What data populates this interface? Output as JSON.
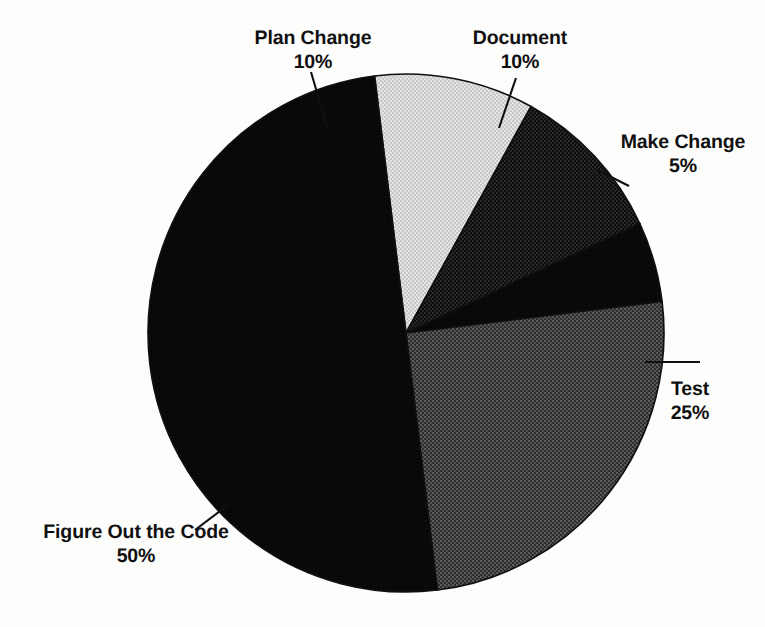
{
  "figure": {
    "background_color": "#fdfdfc",
    "ink_color": "#101010"
  },
  "chart_data": {
    "type": "pie",
    "title": "",
    "subtitle": "",
    "xlabel": "",
    "ylabel": "",
    "legend_position": "none",
    "grid": false,
    "labels_show_percent": true,
    "start_angle_deg": -97,
    "direction": "clockwise",
    "categories": [
      "Plan Change",
      "Document",
      "Make Change",
      "Test",
      "Figure Out the Code"
    ],
    "values": [
      10,
      10,
      5,
      25,
      50
    ],
    "value_labels": [
      "10%",
      "10%",
      "5%",
      "25%",
      "50%"
    ],
    "slices": [
      {
        "name": "Plan Change",
        "value": 10,
        "value_label": "10%",
        "fill": "#d6d6d6",
        "pattern": "light-dither",
        "label_position": "top-left"
      },
      {
        "name": "Document",
        "value": 10,
        "value_label": "10%",
        "fill": "#1b1b1b",
        "pattern": "dark-dither",
        "label_position": "top-right"
      },
      {
        "name": "Make Change",
        "value": 5,
        "value_label": "5%",
        "fill": "#070707",
        "pattern": "solid",
        "label_position": "right"
      },
      {
        "name": "Test",
        "value": 25,
        "value_label": "25%",
        "fill": "#454545",
        "pattern": "medium-dither",
        "label_position": "bottom-right"
      },
      {
        "name": "Figure Out the Code",
        "value": 50,
        "value_label": "50%",
        "fill": "#0a0a0a",
        "pattern": "solid",
        "label_position": "bottom-left"
      }
    ]
  },
  "labels": {
    "plan_change": {
      "name": "Plan Change",
      "pct": "10%"
    },
    "document": {
      "name": "Document",
      "pct": "10%"
    },
    "make_change": {
      "name": "Make Change",
      "pct": "5%"
    },
    "test": {
      "name": "Test",
      "pct": "25%"
    },
    "figure_out_the_code": {
      "name": "Figure Out the Code",
      "pct": "50%"
    }
  }
}
